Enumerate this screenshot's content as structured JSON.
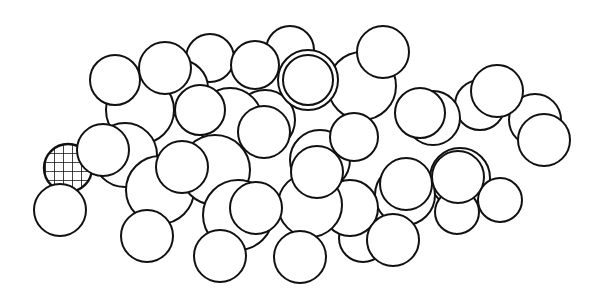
{
  "figure": {
    "type": "space-filling molecular model",
    "style": "black outline line art on white",
    "background": "#ffffff",
    "stroke": "#111111",
    "highlighted_atom": {
      "pattern": "crosshatch",
      "cx": 68,
      "cy": 168,
      "r": 24
    }
  },
  "atoms_back_to_front": [
    {
      "cx": 535,
      "cy": 120,
      "r": 26
    },
    {
      "cx": 480,
      "cy": 105,
      "r": 25
    },
    {
      "cx": 433,
      "cy": 118,
      "r": 27
    },
    {
      "cx": 362,
      "cy": 86,
      "r": 34
    },
    {
      "cx": 460,
      "cy": 178,
      "r": 30
    },
    {
      "cx": 500,
      "cy": 200,
      "r": 22
    },
    {
      "cx": 457,
      "cy": 212,
      "r": 22
    },
    {
      "cx": 405,
      "cy": 195,
      "r": 30
    },
    {
      "cx": 363,
      "cy": 238,
      "r": 24
    },
    {
      "cx": 350,
      "cy": 208,
      "r": 28
    },
    {
      "cx": 320,
      "cy": 160,
      "r": 30
    },
    {
      "cx": 265,
      "cy": 120,
      "r": 30
    },
    {
      "cx": 230,
      "cy": 120,
      "r": 32
    },
    {
      "cx": 210,
      "cy": 58,
      "r": 24
    },
    {
      "cx": 180,
      "cy": 88,
      "r": 28
    },
    {
      "cx": 140,
      "cy": 110,
      "r": 34
    },
    {
      "cx": 115,
      "cy": 80,
      "r": 25
    },
    {
      "cx": 125,
      "cy": 155,
      "r": 32
    },
    {
      "cx": 160,
      "cy": 190,
      "r": 34
    },
    {
      "cx": 215,
      "cy": 170,
      "r": 35
    },
    {
      "cx": 238,
      "cy": 215,
      "r": 35
    },
    {
      "cx": 310,
      "cy": 205,
      "r": 32
    },
    {
      "cx": 290,
      "cy": 50,
      "r": 24
    },
    {
      "cx": 255,
      "cy": 65,
      "r": 24
    },
    {
      "cx": 200,
      "cy": 110,
      "r": 25
    },
    {
      "cx": 165,
      "cy": 68,
      "r": 26
    },
    {
      "cx": 308,
      "cy": 80,
      "r": 30
    },
    {
      "cx": 308,
      "cy": 80,
      "r": 25
    },
    {
      "cx": 383,
      "cy": 52,
      "r": 26
    },
    {
      "cx": 264,
      "cy": 132,
      "r": 26
    },
    {
      "cx": 354,
      "cy": 137,
      "r": 24
    },
    {
      "cx": 420,
      "cy": 113,
      "r": 25
    },
    {
      "cx": 497,
      "cy": 91,
      "r": 26
    },
    {
      "cx": 544,
      "cy": 140,
      "r": 26
    },
    {
      "cx": 458,
      "cy": 177,
      "r": 26
    },
    {
      "cx": 406,
      "cy": 184,
      "r": 26
    },
    {
      "cx": 317,
      "cy": 172,
      "r": 26
    },
    {
      "cx": 256,
      "cy": 208,
      "r": 26
    },
    {
      "cx": 182,
      "cy": 167,
      "r": 26
    },
    {
      "cx": 103,
      "cy": 150,
      "r": 26
    },
    {
      "cx": 393,
      "cy": 240,
      "r": 26
    },
    {
      "cx": 300,
      "cy": 257,
      "r": 26
    },
    {
      "cx": 220,
      "cy": 256,
      "r": 26
    },
    {
      "cx": 147,
      "cy": 236,
      "r": 26
    },
    {
      "cx": 60,
      "cy": 210,
      "r": 26
    }
  ]
}
